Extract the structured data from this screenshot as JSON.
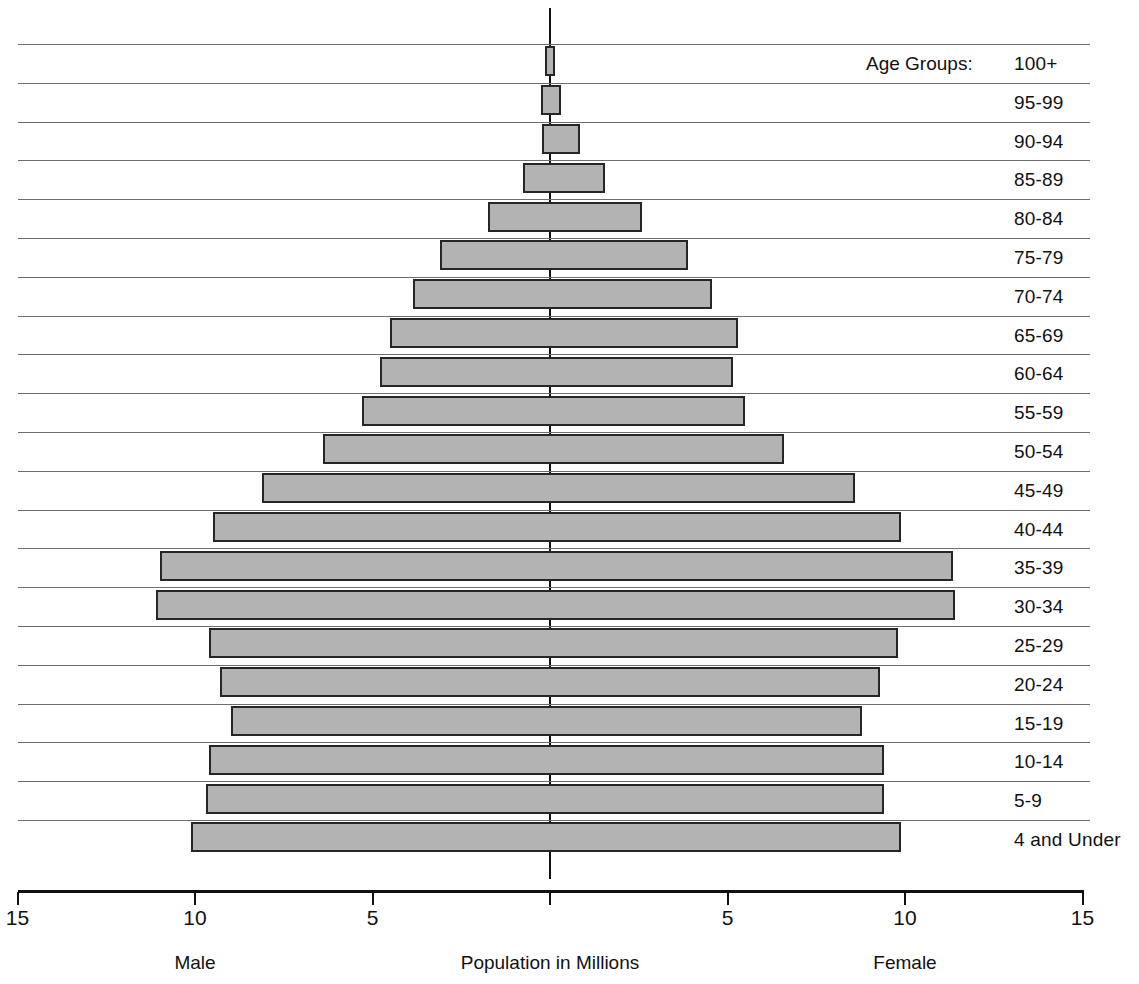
{
  "chart_data": {
    "type": "bar",
    "subtype": "population-pyramid",
    "title": "",
    "xlabel": "Population in Millions",
    "ylabel": "",
    "axis_caption_left": "Male",
    "axis_caption_center": "Population in Millions",
    "axis_caption_right": "Female",
    "age_groups_caption": "Age Groups:",
    "grid": true,
    "legend_position": "none",
    "xlim": [
      -15,
      15
    ],
    "xticks": [
      15,
      10,
      5,
      0,
      5,
      10,
      15
    ],
    "xtick_labels": [
      "15",
      "10",
      "5",
      "",
      "5",
      "10",
      "15"
    ],
    "units": "millions",
    "categories": [
      "100+",
      "95-99",
      "90-94",
      "85-89",
      "80-84",
      "75-79",
      "70-74",
      "65-69",
      "60-64",
      "55-59",
      "50-54",
      "45-49",
      "40-44",
      "35-39",
      "30-34",
      "25-29",
      "20-24",
      "15-19",
      "10-14",
      "5-9",
      "4 and Under"
    ],
    "series": [
      {
        "name": "Male",
        "side": "left",
        "values": [
          0.15,
          0.25,
          0.23,
          0.75,
          1.75,
          3.1,
          3.85,
          4.5,
          4.8,
          5.3,
          6.4,
          8.1,
          9.5,
          11.0,
          11.1,
          9.6,
          9.3,
          9.0,
          9.6,
          9.7,
          10.1
        ]
      },
      {
        "name": "Female",
        "side": "right",
        "values": [
          0.15,
          0.3,
          0.85,
          1.55,
          2.6,
          3.9,
          4.55,
          5.3,
          5.15,
          5.5,
          6.6,
          8.6,
          9.9,
          11.35,
          11.4,
          9.8,
          9.3,
          8.8,
          9.4,
          9.4,
          9.9
        ]
      }
    ],
    "colors": {
      "bar_fill": "#b3b3b3",
      "bar_stroke": "#262626",
      "gridline": "#6e6e6e",
      "axis": "#111111",
      "background": "#ffffff"
    }
  }
}
